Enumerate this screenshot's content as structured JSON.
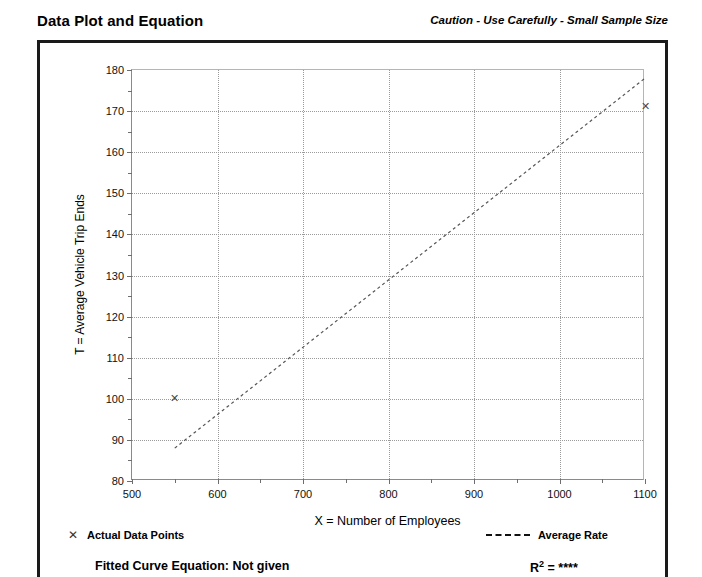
{
  "header": {
    "title": "Data Plot and Equation",
    "caution": "Caution - Use Carefully - Small Sample Size"
  },
  "footer": {
    "legend_points_label": "Actual Data Points",
    "legend_points_marker": "x-marker-icon",
    "legend_rate_label": "Average Rate",
    "legend_rate_marker": "dashed-line-icon",
    "fitted_equation": "Fitted Curve Equation:  Not given",
    "r_squared_label": "R",
    "r_squared_exponent": "2",
    "r_squared_value": "= ****"
  },
  "chart_data": {
    "type": "scatter",
    "title": "",
    "xlabel": "X = Number of Employees",
    "ylabel": "T = Average Vehicle Trip Ends",
    "xlim": [
      500,
      1100
    ],
    "ylim": [
      80,
      180
    ],
    "xticks": [
      500,
      600,
      700,
      800,
      900,
      1000,
      1100
    ],
    "yticks": [
      80,
      90,
      100,
      110,
      120,
      130,
      140,
      150,
      160,
      170,
      180
    ],
    "xtick_labels": [
      "500",
      "600",
      "700",
      "800",
      "900",
      "1000",
      "1100"
    ],
    "ytick_labels": [
      "80",
      "90",
      "100",
      "110",
      "120",
      "130",
      "140",
      "150",
      "160",
      "170",
      "180"
    ],
    "minor_ticks": true,
    "grid": true,
    "grid_style": "dotted",
    "legend_position": "below-plot",
    "series": [
      {
        "name": "Actual Data Points",
        "type": "scatter",
        "marker": "x",
        "points": [
          {
            "x": 550,
            "y": 100
          },
          {
            "x": 1100,
            "y": 171
          }
        ]
      },
      {
        "name": "Average Rate",
        "type": "line",
        "style": "dashed",
        "points": [
          {
            "x": 550,
            "y": 88
          },
          {
            "x": 1100,
            "y": 178
          }
        ]
      }
    ]
  }
}
